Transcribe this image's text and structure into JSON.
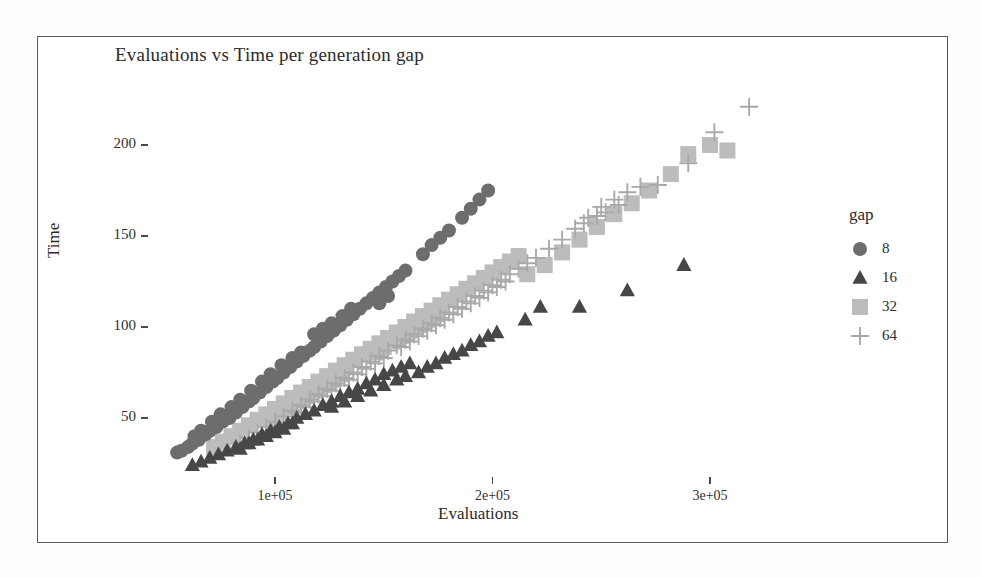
{
  "figure": {
    "title": "Evaluations vs Time per generation gap",
    "xlabel": "Evaluations",
    "ylabel": "Time",
    "legend_title": "gap"
  },
  "axes": {
    "x_ticks": [
      "1e+05",
      "2e+05",
      "3e+05"
    ],
    "y_ticks": [
      "200",
      "150",
      "100",
      "50"
    ]
  },
  "legend": {
    "entries": [
      {
        "label": "8",
        "symbol": "circle",
        "color": "#6d6d6d"
      },
      {
        "label": "16",
        "symbol": "triangle",
        "color": "#474747"
      },
      {
        "label": "32",
        "symbol": "square",
        "color": "#bcbcbc"
      },
      {
        "label": "64",
        "symbol": "plus",
        "color": "#a9a9a9"
      }
    ]
  },
  "chart_data": {
    "type": "scatter",
    "title": "Evaluations vs Time per generation gap",
    "xlabel": "Evaluations",
    "ylabel": "Time",
    "legend_title": "gap",
    "legend_position": "right",
    "grid": false,
    "xlim": [
      30000,
      345000
    ],
    "ylim": [
      18,
      228
    ],
    "x_tick_values": [
      100000,
      200000,
      300000
    ],
    "x_tick_labels": [
      "1e+05",
      "2e+05",
      "3e+05"
    ],
    "y_tick_values": [
      50,
      100,
      150,
      200
    ],
    "y_tick_labels": [
      "50",
      "100",
      "150",
      "200"
    ],
    "series": [
      {
        "name": "8",
        "gap": 8,
        "symbol": "circle",
        "color": "#6d6d6d",
        "points": [
          [
            55000,
            31
          ],
          [
            57000,
            32
          ],
          [
            60000,
            34
          ],
          [
            62000,
            36
          ],
          [
            65000,
            38
          ],
          [
            68000,
            41
          ],
          [
            70000,
            43
          ],
          [
            73000,
            45
          ],
          [
            76000,
            48
          ],
          [
            79000,
            50
          ],
          [
            82000,
            53
          ],
          [
            85000,
            56
          ],
          [
            88000,
            59
          ],
          [
            90000,
            61
          ],
          [
            93000,
            64
          ],
          [
            96000,
            67
          ],
          [
            99000,
            70
          ],
          [
            101000,
            72
          ],
          [
            104000,
            75
          ],
          [
            107000,
            78
          ],
          [
            110000,
            81
          ],
          [
            113000,
            84
          ],
          [
            116000,
            87
          ],
          [
            118000,
            89
          ],
          [
            121000,
            92
          ],
          [
            124000,
            95
          ],
          [
            127000,
            98
          ],
          [
            130000,
            101
          ],
          [
            133000,
            104
          ],
          [
            136000,
            107
          ],
          [
            139000,
            110
          ],
          [
            142000,
            113
          ],
          [
            145000,
            116
          ],
          [
            148000,
            119
          ],
          [
            151000,
            122
          ],
          [
            154000,
            125
          ],
          [
            157000,
            128
          ],
          [
            160000,
            131
          ],
          [
            148000,
            113
          ],
          [
            152000,
            117
          ],
          [
            168000,
            140
          ],
          [
            172000,
            145
          ],
          [
            176000,
            149
          ],
          [
            180000,
            153
          ],
          [
            186000,
            160
          ],
          [
            190000,
            165
          ],
          [
            194000,
            170
          ],
          [
            198000,
            175
          ],
          [
            118000,
            96
          ],
          [
            122000,
            99
          ],
          [
            126000,
            102
          ],
          [
            131000,
            106
          ],
          [
            135000,
            110
          ],
          [
            112000,
            86
          ],
          [
            108000,
            83
          ],
          [
            103000,
            79
          ],
          [
            98000,
            74
          ],
          [
            94000,
            70
          ],
          [
            89000,
            65
          ],
          [
            84000,
            60
          ],
          [
            80000,
            56
          ],
          [
            75000,
            52
          ],
          [
            71000,
            48
          ],
          [
            66000,
            43
          ],
          [
            63000,
            40
          ]
        ]
      },
      {
        "name": "16",
        "gap": 16,
        "symbol": "triangle",
        "color": "#474747",
        "points": [
          [
            62000,
            24
          ],
          [
            66000,
            26
          ],
          [
            70000,
            28
          ],
          [
            74000,
            30
          ],
          [
            78000,
            32
          ],
          [
            82000,
            34
          ],
          [
            86000,
            36
          ],
          [
            90000,
            38
          ],
          [
            94000,
            41
          ],
          [
            98000,
            43
          ],
          [
            102000,
            45
          ],
          [
            106000,
            47
          ],
          [
            110000,
            50
          ],
          [
            114000,
            52
          ],
          [
            118000,
            54
          ],
          [
            122000,
            57
          ],
          [
            126000,
            59
          ],
          [
            130000,
            62
          ],
          [
            134000,
            64
          ],
          [
            138000,
            66
          ],
          [
            142000,
            69
          ],
          [
            146000,
            71
          ],
          [
            150000,
            74
          ],
          [
            154000,
            76
          ],
          [
            158000,
            78
          ],
          [
            162000,
            80
          ],
          [
            166000,
            75
          ],
          [
            170000,
            78
          ],
          [
            174000,
            80
          ],
          [
            178000,
            83
          ],
          [
            182000,
            85
          ],
          [
            186000,
            87
          ],
          [
            190000,
            90
          ],
          [
            194000,
            92
          ],
          [
            198000,
            95
          ],
          [
            202000,
            97
          ],
          [
            215000,
            104
          ],
          [
            222000,
            111
          ],
          [
            240000,
            111
          ],
          [
            262000,
            120
          ],
          [
            288000,
            134
          ],
          [
            126000,
            56
          ],
          [
            132000,
            59
          ],
          [
            138000,
            62
          ],
          [
            144000,
            65
          ],
          [
            150000,
            68
          ],
          [
            156000,
            71
          ],
          [
            160000,
            73
          ],
          [
            108000,
            47
          ],
          [
            104000,
            44
          ],
          [
            100000,
            42
          ],
          [
            96000,
            40
          ],
          [
            92000,
            38
          ],
          [
            88000,
            36
          ],
          [
            84000,
            33
          ]
        ]
      },
      {
        "name": "32",
        "gap": 32,
        "symbol": "square",
        "color": "#bcbcbc",
        "points": [
          [
            72000,
            34
          ],
          [
            76000,
            37
          ],
          [
            80000,
            40
          ],
          [
            84000,
            43
          ],
          [
            88000,
            46
          ],
          [
            92000,
            49
          ],
          [
            96000,
            52
          ],
          [
            100000,
            55
          ],
          [
            104000,
            58
          ],
          [
            108000,
            61
          ],
          [
            112000,
            64
          ],
          [
            116000,
            67
          ],
          [
            120000,
            70
          ],
          [
            124000,
            73
          ],
          [
            128000,
            76
          ],
          [
            132000,
            79
          ],
          [
            136000,
            82
          ],
          [
            140000,
            85
          ],
          [
            144000,
            88
          ],
          [
            148000,
            91
          ],
          [
            152000,
            94
          ],
          [
            156000,
            97
          ],
          [
            160000,
            100
          ],
          [
            164000,
            103
          ],
          [
            168000,
            106
          ],
          [
            172000,
            109
          ],
          [
            176000,
            112
          ],
          [
            180000,
            115
          ],
          [
            184000,
            118
          ],
          [
            188000,
            121
          ],
          [
            192000,
            124
          ],
          [
            196000,
            127
          ],
          [
            200000,
            130
          ],
          [
            204000,
            133
          ],
          [
            208000,
            136
          ],
          [
            212000,
            139
          ],
          [
            216000,
            129
          ],
          [
            224000,
            134
          ],
          [
            232000,
            141
          ],
          [
            240000,
            148
          ],
          [
            248000,
            155
          ],
          [
            256000,
            162
          ],
          [
            264000,
            168
          ],
          [
            272000,
            175
          ],
          [
            282000,
            184
          ],
          [
            290000,
            195
          ],
          [
            300000,
            200
          ],
          [
            308000,
            197
          ],
          [
            146000,
            86
          ],
          [
            150000,
            89
          ],
          [
            154000,
            92
          ],
          [
            158000,
            95
          ],
          [
            162000,
            98
          ],
          [
            166000,
            101
          ],
          [
            170000,
            104
          ],
          [
            174000,
            107
          ],
          [
            130000,
            74
          ],
          [
            126000,
            71
          ],
          [
            122000,
            68
          ],
          [
            118000,
            65
          ],
          [
            114000,
            62
          ],
          [
            110000,
            59
          ],
          [
            106000,
            56
          ],
          [
            102000,
            53
          ],
          [
            98000,
            50
          ]
        ]
      },
      {
        "name": "64",
        "gap": 64,
        "symbol": "plus",
        "color": "#a9a9a9",
        "points": [
          [
            84000,
            36
          ],
          [
            88000,
            39
          ],
          [
            92000,
            42
          ],
          [
            96000,
            45
          ],
          [
            100000,
            48
          ],
          [
            104000,
            51
          ],
          [
            108000,
            54
          ],
          [
            112000,
            57
          ],
          [
            116000,
            60
          ],
          [
            120000,
            63
          ],
          [
            124000,
            66
          ],
          [
            128000,
            69
          ],
          [
            132000,
            72
          ],
          [
            136000,
            75
          ],
          [
            140000,
            78
          ],
          [
            144000,
            81
          ],
          [
            148000,
            84
          ],
          [
            152000,
            87
          ],
          [
            156000,
            90
          ],
          [
            160000,
            93
          ],
          [
            164000,
            96
          ],
          [
            168000,
            99
          ],
          [
            172000,
            102
          ],
          [
            176000,
            105
          ],
          [
            180000,
            108
          ],
          [
            184000,
            111
          ],
          [
            188000,
            114
          ],
          [
            192000,
            117
          ],
          [
            196000,
            120
          ],
          [
            200000,
            123
          ],
          [
            204000,
            126
          ],
          [
            208000,
            129
          ],
          [
            212000,
            132
          ],
          [
            216000,
            135
          ],
          [
            220000,
            138
          ],
          [
            226000,
            143
          ],
          [
            232000,
            148
          ],
          [
            238000,
            154
          ],
          [
            244000,
            160
          ],
          [
            250000,
            166
          ],
          [
            256000,
            170
          ],
          [
            262000,
            174
          ],
          [
            268000,
            177
          ],
          [
            276000,
            178
          ],
          [
            290000,
            190
          ],
          [
            302000,
            207
          ],
          [
            318000,
            221
          ],
          [
            252000,
            163
          ],
          [
            258000,
            167
          ],
          [
            242000,
            157
          ],
          [
            248000,
            161
          ],
          [
            158000,
            89
          ],
          [
            162000,
            92
          ],
          [
            166000,
            95
          ],
          [
            170000,
            98
          ],
          [
            174000,
            101
          ],
          [
            178000,
            104
          ],
          [
            182000,
            107
          ],
          [
            186000,
            110
          ],
          [
            190000,
            113
          ],
          [
            194000,
            116
          ],
          [
            198000,
            119
          ],
          [
            202000,
            122
          ],
          [
            206000,
            125
          ],
          [
            150000,
            83
          ],
          [
            146000,
            80
          ],
          [
            142000,
            77
          ],
          [
            138000,
            74
          ],
          [
            134000,
            71
          ],
          [
            130000,
            68
          ],
          [
            126000,
            65
          ],
          [
            122000,
            62
          ],
          [
            118000,
            59
          ],
          [
            114000,
            56
          ],
          [
            110000,
            53
          ]
        ]
      }
    ]
  }
}
